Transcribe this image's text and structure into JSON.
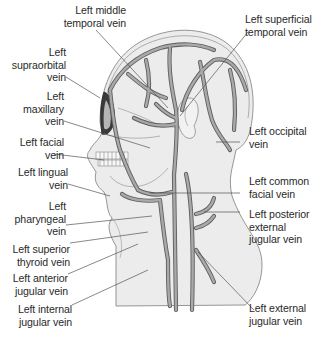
{
  "diagram": {
    "colors": {
      "background": "#ffffff",
      "skin_fill": "#ececec",
      "skin_outline": "#8a8a8a",
      "vein_fill": "#a9a9a9",
      "vein_outline": "#5e5e5e",
      "leader_line": "#555555",
      "label_text": "#2a2a2a"
    },
    "labels_left": [
      {
        "id": "left-middle-temporal-vein",
        "text": "Left middle\ntemporal vein"
      },
      {
        "id": "left-supraorbital-vein",
        "text": "Left\nsupraorbital\nvein"
      },
      {
        "id": "left-maxillary-vein",
        "text": "Left\nmaxillary\nvein"
      },
      {
        "id": "left-facial-vein",
        "text": "Left facial\nvein"
      },
      {
        "id": "left-lingual-vein",
        "text": "Left lingual\nvein"
      },
      {
        "id": "left-pharyngeal-vein",
        "text": "Left\npharyngeal\nvein"
      },
      {
        "id": "left-superior-thyroid-vein",
        "text": "Left superior\nthyroid vein"
      },
      {
        "id": "left-anterior-jugular-vein",
        "text": "Left anterior\njugular vein"
      },
      {
        "id": "left-internal-jugular-vein",
        "text": "Left internal\njugular vein"
      }
    ],
    "labels_right": [
      {
        "id": "left-superficial-temporal-vein",
        "text": "Left superficial\ntemporal vein"
      },
      {
        "id": "left-occipital-vein",
        "text": "Left occipital\nvein"
      },
      {
        "id": "left-common-facial-vein",
        "text": "Left common\nfacial vein"
      },
      {
        "id": "left-posterior-external-jugular-vein",
        "text": "Left posterior\nexternal\njugular vein"
      },
      {
        "id": "left-external-jugular-vein",
        "text": "Left external\njugular vein"
      }
    ]
  }
}
